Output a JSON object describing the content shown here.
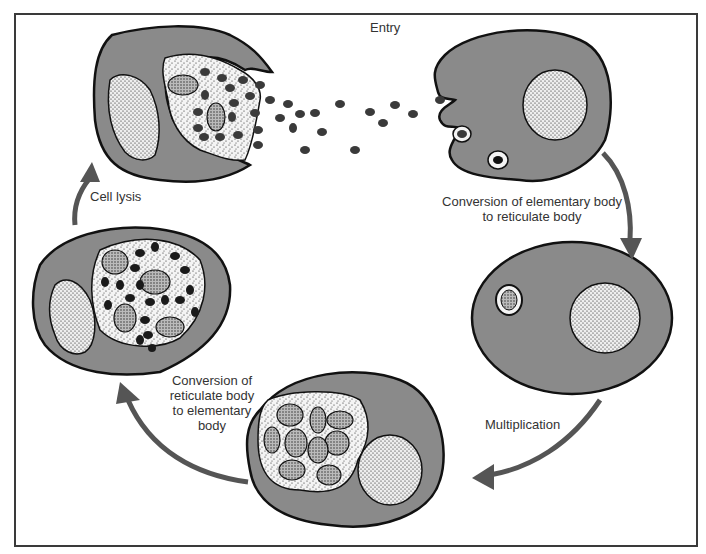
{
  "diagram": {
    "type": "cycle",
    "colors": {
      "cytoplasm": "#8a8a8a",
      "outline": "#111111",
      "arrow": "#555555",
      "vacuole": "#f4f4f4",
      "nucleus": "#f2f2f2",
      "elementary_body": "#3a3a3a"
    },
    "stages": [
      {
        "id": "entry",
        "label": "Entry"
      },
      {
        "id": "eb-to-rb",
        "label_line1": "Conversion of elementary body",
        "label_line2": "to reticulate body"
      },
      {
        "id": "multiplication",
        "label": "Multiplication"
      },
      {
        "id": "rb-to-eb",
        "label_line1": "Conversion of",
        "label_line2": "reticulate body",
        "label_line3": "to elementary",
        "label_line4": "body"
      },
      {
        "id": "cell-lysis",
        "label": "Cell lysis"
      }
    ],
    "cells": [
      {
        "id": "lysing-cell",
        "description": "Ruptured host cell releasing elementary bodies"
      },
      {
        "id": "infected-cell-entry",
        "description": "Host cell engulfing elementary bodies"
      },
      {
        "id": "cell-single-rb",
        "description": "Host cell with single reticulate body inclusion"
      },
      {
        "id": "cell-multiplying-rb",
        "description": "Host cell with inclusion of multiplying reticulate bodies"
      },
      {
        "id": "cell-mixed-inclusion",
        "description": "Host cell with inclusion containing reticulate and elementary bodies"
      }
    ]
  }
}
